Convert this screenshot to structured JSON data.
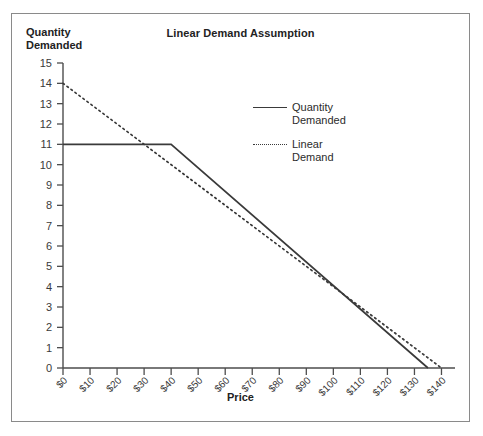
{
  "chart_data": {
    "type": "line",
    "title": "Linear Demand Assumption",
    "xlabel": "Price",
    "ylabel_line1": "Quantity",
    "ylabel_line2": "Demanded",
    "ylabel": "Quantity Demanded",
    "grid": false,
    "legend_position": "upper-right-inside",
    "xlim": [
      0,
      145
    ],
    "ylim": [
      0,
      15
    ],
    "x_tick_labels": [
      "$0",
      "$10",
      "$20",
      "$30",
      "$40",
      "$50",
      "$60",
      "$70",
      "$80",
      "$90",
      "$100",
      "$110",
      "$120",
      "$130",
      "$140"
    ],
    "x_tick_values": [
      0,
      10,
      20,
      30,
      40,
      50,
      60,
      70,
      80,
      90,
      100,
      110,
      120,
      130,
      140
    ],
    "y_tick_labels": [
      "0",
      "1",
      "2",
      "3",
      "4",
      "5",
      "6",
      "7",
      "8",
      "9",
      "10",
      "11",
      "12",
      "13",
      "14",
      "15"
    ],
    "y_tick_values": [
      0,
      1,
      2,
      3,
      4,
      5,
      6,
      7,
      8,
      9,
      10,
      11,
      12,
      13,
      14,
      15
    ],
    "series": [
      {
        "name": "Quantity Demanded",
        "name_line1": "Quantity",
        "name_line2": "Demanded",
        "style": "solid",
        "color": "#3a3a3a",
        "x": [
          0,
          40,
          135
        ],
        "values": [
          11,
          11,
          0
        ]
      },
      {
        "name": "Linear Demand",
        "name_line1": "Linear",
        "name_line2": "Demand",
        "style": "dotted",
        "color": "#3a3a3a",
        "x": [
          0,
          140
        ],
        "values": [
          14,
          0
        ]
      }
    ]
  },
  "figure": {
    "border_color": "#8a8a8a",
    "background": "#ffffff"
  }
}
